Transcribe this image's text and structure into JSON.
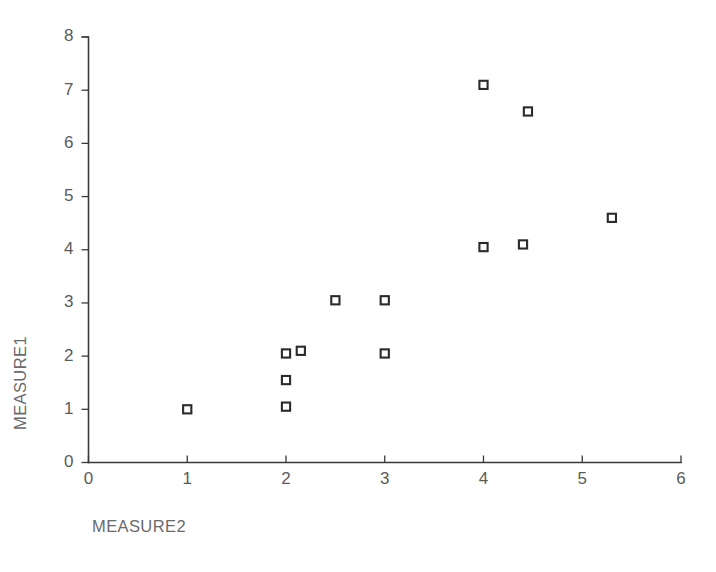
{
  "chart_data": {
    "type": "scatter",
    "title": "",
    "xlabel": "MEASURE2",
    "ylabel": "MEASURE1",
    "xlim": [
      0,
      6
    ],
    "ylim": [
      0,
      8
    ],
    "xticks": [
      0,
      1,
      2,
      3,
      4,
      5,
      6
    ],
    "yticks": [
      0,
      1,
      2,
      3,
      4,
      5,
      6,
      7,
      8
    ],
    "xtick_labels": [
      "0",
      "1",
      "2",
      "3",
      "4",
      "5",
      "6"
    ],
    "ytick_labels": [
      "0",
      "1",
      "2",
      "3",
      "4",
      "5",
      "6",
      "7",
      "8"
    ],
    "grid": false,
    "legend": false,
    "marker": "open-square",
    "marker_color": "#2b2b2b",
    "marker_fill": "#ffffff",
    "axis_color": "#3a3a3a",
    "label_color": "#6a6a6a",
    "background": "#ffffff",
    "points": [
      {
        "x": 1.0,
        "y": 1.0
      },
      {
        "x": 2.0,
        "y": 1.05
      },
      {
        "x": 2.0,
        "y": 1.55
      },
      {
        "x": 2.0,
        "y": 2.05
      },
      {
        "x": 2.15,
        "y": 2.1
      },
      {
        "x": 2.5,
        "y": 3.05
      },
      {
        "x": 3.0,
        "y": 2.05
      },
      {
        "x": 3.0,
        "y": 3.05
      },
      {
        "x": 4.0,
        "y": 4.05
      },
      {
        "x": 4.0,
        "y": 7.1
      },
      {
        "x": 4.4,
        "y": 4.1
      },
      {
        "x": 4.45,
        "y": 6.6
      },
      {
        "x": 5.3,
        "y": 4.6
      }
    ]
  }
}
